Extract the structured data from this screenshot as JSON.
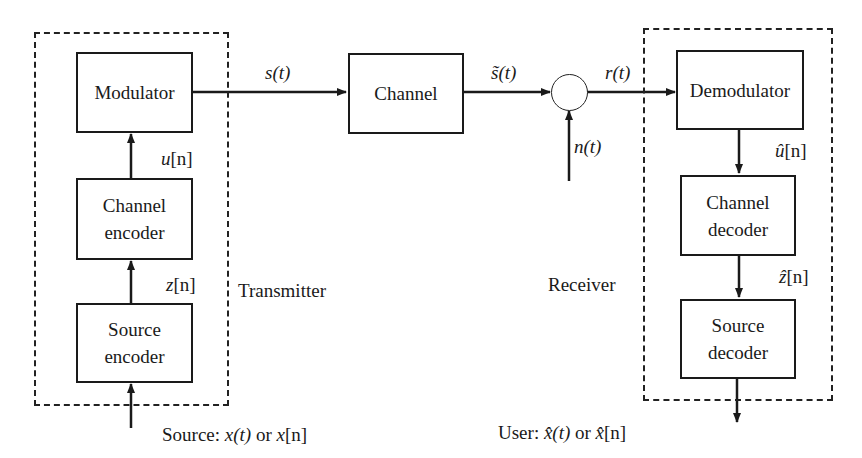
{
  "diagram": {
    "type": "block-diagram"
  },
  "groups": {
    "transmitter": {
      "label": "Transmitter"
    },
    "receiver": {
      "label": "Receiver"
    }
  },
  "blocks": {
    "modulator": {
      "label": "Modulator"
    },
    "channel_encoder": {
      "line1": "Channel",
      "line2": "encoder"
    },
    "source_encoder": {
      "line1": "Source",
      "line2": "encoder"
    },
    "channel": {
      "label": "Channel"
    },
    "demodulator": {
      "label": "Demodulator"
    },
    "channel_decoder": {
      "line1": "Channel",
      "line2": "decoder"
    },
    "source_decoder": {
      "line1": "Source",
      "line2": "decoder"
    }
  },
  "signals": {
    "s_t": {
      "base": "s",
      "arg": "(t)"
    },
    "s_tilde_t": {
      "base": "s̃",
      "arg": "(t)"
    },
    "r_t": {
      "base": "r",
      "arg": "(t)"
    },
    "n_t": {
      "base": "n",
      "arg": "(t)"
    },
    "u_n": {
      "base": "u",
      "arg": "[n]"
    },
    "z_n": {
      "base": "z",
      "arg": "[n]"
    },
    "u_hat_n": {
      "base": "û",
      "arg": "[n]"
    },
    "z_hat_n": {
      "base": "ẑ",
      "arg": "[n]"
    }
  },
  "io": {
    "source": {
      "prefix": "Source: ",
      "a": "x",
      "a_arg": "(t)",
      "or": " or ",
      "b": "x",
      "b_arg": "[n]"
    },
    "user": {
      "prefix": "User: ",
      "a": "x̂",
      "a_arg": "(t)",
      "or": " or ",
      "b": "x̂",
      "b_arg": "[n]"
    }
  },
  "colors": {
    "stroke": "#1a1a1a",
    "background": "#ffffff"
  }
}
